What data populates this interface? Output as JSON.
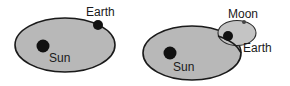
{
  "diagrams": [
    {
      "name": "sun-earth-orbit",
      "labels": {
        "sun": "Sun",
        "earth": "Earth"
      }
    },
    {
      "name": "sun-earth-moon-orbit",
      "labels": {
        "sun": "Sun",
        "earth": "Earth",
        "moon": "Moon"
      }
    }
  ],
  "colors": {
    "orbit_fill": "#b8b8b8",
    "orbit_stroke": "#1a1a1a",
    "body_fill": "#111111",
    "background": "#ffffff"
  }
}
